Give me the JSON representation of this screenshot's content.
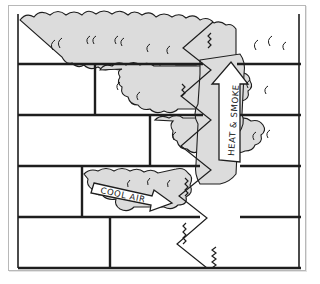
{
  "diagram": {
    "labels": {
      "cool_air": "COOL AIR",
      "heat_smoke": "HEAT & SMOKE"
    },
    "elements": [
      "building-cross-section",
      "stairwell",
      "smoke-clouds",
      "cool-air-arrow",
      "heat-smoke-arrow"
    ],
    "floors": 5,
    "colors": {
      "line": "#1e1e1e",
      "smoke_fill": "#dcdcdc",
      "background": "#ffffff",
      "frame": "#b8b8b8"
    }
  }
}
